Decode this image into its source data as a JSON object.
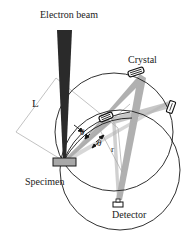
{
  "diagram": {
    "labels": {
      "electron_beam": "Electron beam",
      "crystal": "Crystal",
      "specimen": "Specimen",
      "detector": "Detector",
      "distance": "L",
      "radius": "r",
      "angle1": "θ",
      "angle2": "θ"
    },
    "colors": {
      "beam": "#2a2a2a",
      "xray": "#9a9a9a",
      "line": "#1a1a1a",
      "guide": "#b0b0b0",
      "specimen_fill": "#a8a8a8"
    }
  }
}
